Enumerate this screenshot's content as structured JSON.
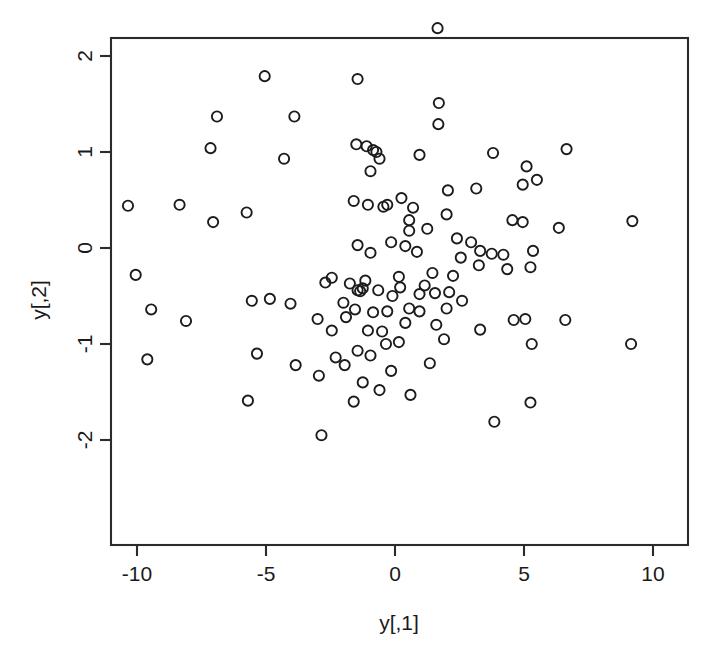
{
  "chart_data": {
    "type": "scatter",
    "title": "",
    "xlabel": "y[,1]",
    "ylabel": "y[,2]",
    "xlim": [
      -11.2,
      11.35
    ],
    "ylim": [
      -2.18,
      3.18
    ],
    "xticks": [
      -10,
      -5,
      0,
      5,
      10
    ],
    "yticks": [
      -2,
      -1,
      0,
      1,
      2,
      3
    ],
    "xtick_labels": [
      "-10",
      "-5",
      "0",
      "5",
      "10"
    ],
    "ytick_labels": [
      "-2",
      "-1",
      "0",
      "1",
      "2",
      "3"
    ],
    "grid": false,
    "legend": null,
    "marker": "open-circle",
    "marker_color": "#1c1c1c",
    "n_points": 120,
    "points": [
      [
        1.2,
        2.93
      ],
      [
        1.65,
        2.29
      ],
      [
        -5.05,
        1.79
      ],
      [
        -1.45,
        1.76
      ],
      [
        1.7,
        1.51
      ],
      [
        -6.9,
        1.37
      ],
      [
        -3.9,
        1.37
      ],
      [
        1.68,
        1.29
      ],
      [
        -7.15,
        1.04
      ],
      [
        6.65,
        1.03
      ],
      [
        -1.5,
        1.08
      ],
      [
        -1.1,
        1.06
      ],
      [
        -0.85,
        1.02
      ],
      [
        -0.72,
        1.0
      ],
      [
        3.8,
        0.99
      ],
      [
        -4.3,
        0.93
      ],
      [
        -0.6,
        0.93
      ],
      [
        0.95,
        0.97
      ],
      [
        5.1,
        0.85
      ],
      [
        -0.95,
        0.8
      ],
      [
        5.5,
        0.71
      ],
      [
        4.95,
        0.66
      ],
      [
        2.05,
        0.6
      ],
      [
        0.25,
        0.52
      ],
      [
        -1.6,
        0.49
      ],
      [
        -1.05,
        0.45
      ],
      [
        -0.45,
        0.43
      ],
      [
        -10.35,
        0.44
      ],
      [
        -8.35,
        0.45
      ],
      [
        -7.05,
        0.27
      ],
      [
        -5.75,
        0.37
      ],
      [
        4.55,
        0.29
      ],
      [
        4.95,
        0.27
      ],
      [
        9.2,
        0.28
      ],
      [
        6.35,
        0.21
      ],
      [
        0.55,
        0.29
      ],
      [
        0.55,
        0.18
      ],
      [
        1.25,
        0.2
      ],
      [
        -10.05,
        -0.28
      ],
      [
        2.4,
        0.1
      ],
      [
        2.95,
        0.06
      ],
      [
        -0.15,
        0.06
      ],
      [
        0.4,
        0.02
      ],
      [
        -1.45,
        0.03
      ],
      [
        -0.95,
        -0.05
      ],
      [
        3.3,
        -0.03
      ],
      [
        3.75,
        -0.06
      ],
      [
        4.2,
        -0.07
      ],
      [
        5.35,
        -0.03
      ],
      [
        0.85,
        -0.04
      ],
      [
        3.25,
        -0.18
      ],
      [
        5.25,
        -0.2
      ],
      [
        4.35,
        -0.22
      ],
      [
        -2.45,
        -0.31
      ],
      [
        -1.15,
        -0.34
      ],
      [
        -1.75,
        -0.37
      ],
      [
        -9.45,
        -0.64
      ],
      [
        -9.6,
        -1.16
      ],
      [
        -5.55,
        -0.55
      ],
      [
        -4.85,
        -0.53
      ],
      [
        -8.1,
        -0.76
      ],
      [
        0.15,
        -0.3
      ],
      [
        1.45,
        -0.26
      ],
      [
        2.25,
        -0.29
      ],
      [
        1.15,
        -0.39
      ],
      [
        0.2,
        -0.41
      ],
      [
        -0.65,
        -0.44
      ],
      [
        -1.25,
        -0.42
      ],
      [
        -1.45,
        -0.44
      ],
      [
        -1.35,
        -0.45
      ],
      [
        0.95,
        -0.48
      ],
      [
        1.55,
        -0.47
      ],
      [
        2.1,
        -0.46
      ],
      [
        -0.1,
        -0.5
      ],
      [
        2.6,
        -0.55
      ],
      [
        2.0,
        -0.63
      ],
      [
        -5.35,
        -1.1
      ],
      [
        -3.0,
        -0.74
      ],
      [
        -2.45,
        -0.86
      ],
      [
        -1.55,
        -0.64
      ],
      [
        -0.85,
        -0.67
      ],
      [
        -0.3,
        -0.66
      ],
      [
        0.55,
        -0.63
      ],
      [
        0.95,
        -0.66
      ],
      [
        -1.9,
        -0.72
      ],
      [
        4.6,
        -0.75
      ],
      [
        5.05,
        -0.74
      ],
      [
        6.6,
        -0.75
      ],
      [
        0.4,
        -0.78
      ],
      [
        1.6,
        -0.8
      ],
      [
        -1.05,
        -0.86
      ],
      [
        -0.5,
        -0.87
      ],
      [
        3.3,
        -0.85
      ],
      [
        -2.3,
        -1.14
      ],
      [
        -3.85,
        -1.22
      ],
      [
        1.35,
        -1.2
      ],
      [
        -0.35,
        -1.0
      ],
      [
        0.15,
        -0.98
      ],
      [
        1.9,
        -0.95
      ],
      [
        5.3,
        -1.0
      ],
      [
        9.15,
        -1.0
      ],
      [
        -1.45,
        -1.07
      ],
      [
        -0.95,
        -1.12
      ],
      [
        -0.15,
        -1.28
      ],
      [
        -2.95,
        -1.33
      ],
      [
        -1.25,
        -1.4
      ],
      [
        -0.6,
        -1.48
      ],
      [
        -1.6,
        -1.6
      ],
      [
        -5.7,
        -1.59
      ],
      [
        5.25,
        -1.61
      ],
      [
        3.85,
        -1.81
      ],
      [
        -2.85,
        -1.95
      ],
      [
        -2.0,
        -0.57
      ],
      [
        -4.05,
        -0.58
      ],
      [
        0.7,
        0.42
      ],
      [
        2.55,
        -0.1
      ],
      [
        -0.3,
        0.45
      ],
      [
        3.15,
        0.62
      ],
      [
        -2.7,
        -0.36
      ],
      [
        0.6,
        -1.53
      ],
      [
        -1.95,
        -1.22
      ],
      [
        2.0,
        0.35
      ]
    ]
  },
  "axes": {
    "x_axis_label": "y[,1]",
    "y_axis_label": "y[,2]"
  }
}
